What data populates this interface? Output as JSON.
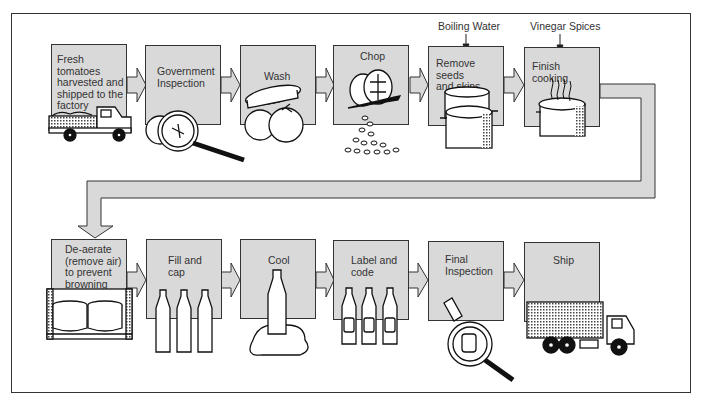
{
  "diagram": {
    "fill_color": "#d9d9d9",
    "line_color": "#333333",
    "row1": [
      {
        "id": "step-1",
        "label": "Fresh tomatoes\nharvested and\nshipped to the\nfactory",
        "icon": "truck-icon"
      },
      {
        "id": "step-2",
        "label": "Government\nInspection",
        "icon": "magnifier-tomato-icon"
      },
      {
        "id": "step-3",
        "label": "Wash",
        "icon": "washing-tomatoes-icon"
      },
      {
        "id": "step-4",
        "label": "Chop",
        "icon": "knife-chopped-tomato-icon"
      },
      {
        "id": "step-5",
        "label": "Remove seeds\nand skins",
        "icon": "pots-icon",
        "input": "Boiling Water"
      },
      {
        "id": "step-6",
        "label": "Finish cooking",
        "icon": "steaming-pot-icon",
        "input": "Vinegar  Spices"
      }
    ],
    "row2": [
      {
        "id": "step-7",
        "label": "De-aerate\n(remove air)\nto prevent\nbrowning",
        "icon": "deaerator-icon"
      },
      {
        "id": "step-8",
        "label": "Fill and\ncap",
        "icon": "bottles-icon"
      },
      {
        "id": "step-9",
        "label": "Cool",
        "icon": "bottle-on-ice-icon"
      },
      {
        "id": "step-10",
        "label": "Label and\ncode",
        "icon": "labeled-bottles-icon"
      },
      {
        "id": "step-11",
        "label": "Final\nInspection",
        "icon": "magnifier-bottle-icon"
      },
      {
        "id": "step-12",
        "label": "Ship",
        "icon": "lorry-icon"
      }
    ]
  }
}
